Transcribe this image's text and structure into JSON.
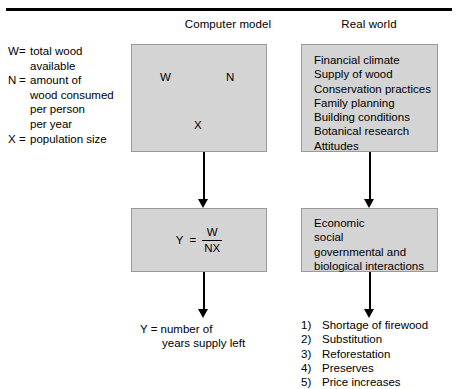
{
  "headers": {
    "computer_model": "Computer model",
    "real_world": "Real world"
  },
  "legend": {
    "items": [
      {
        "symbol": "W",
        "eq": "=",
        "definition": "total wood",
        "continuation": [
          "available"
        ]
      },
      {
        "symbol": "N",
        "eq": "=",
        "definition": "amount of",
        "continuation": [
          "wood consumed",
          "per person",
          "per year"
        ]
      },
      {
        "symbol": "X",
        "eq": "=",
        "definition": "population size",
        "continuation": []
      }
    ]
  },
  "model_box": {
    "variables": [
      {
        "label": "W"
      },
      {
        "label": "N"
      },
      {
        "label": "X"
      }
    ]
  },
  "formula_box": {
    "result": "Y",
    "equals": "=",
    "numerator": "W",
    "denominator": "NX"
  },
  "real_factors_box": {
    "items": [
      "Financial climate",
      "Supply of wood",
      "Conservation practices",
      "Family planning",
      "Building conditions",
      "Botanical research",
      "Attitudes"
    ]
  },
  "interactions_box": {
    "lines": [
      "Economic",
      "social",
      "governmental and",
      "biological interactions"
    ]
  },
  "model_output": {
    "line1": "Y = number of",
    "line2": "years supply left"
  },
  "real_output": {
    "items": [
      {
        "index": "1)",
        "label": "Shortage of firewood"
      },
      {
        "index": "2)",
        "label": "Substitution"
      },
      {
        "index": "3)",
        "label": "Reforestation"
      },
      {
        "index": "4)",
        "label": "Preserves"
      },
      {
        "index": "5)",
        "label": "Price increases"
      }
    ]
  },
  "colors": {
    "box_fill": "#d4d4d4",
    "box_border": "#9a9a9a",
    "rule": "#000000",
    "text": "#000000"
  }
}
